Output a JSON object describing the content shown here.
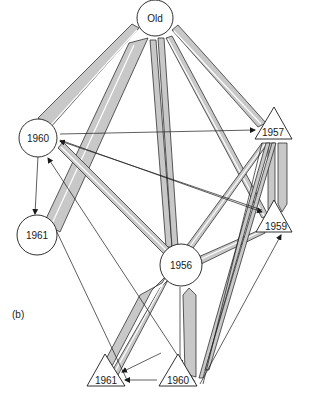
{
  "figure": {
    "panel_label": "(b)",
    "nodes": [
      {
        "id": "old",
        "label": "Old",
        "shape": "circle"
      },
      {
        "id": "c1960",
        "label": "1960",
        "shape": "circle"
      },
      {
        "id": "c1961",
        "label": "1961",
        "shape": "circle"
      },
      {
        "id": "c1956",
        "label": "1956",
        "shape": "circle"
      },
      {
        "id": "t1957",
        "label": "1957",
        "shape": "triangle"
      },
      {
        "id": "t1959",
        "label": "1959",
        "shape": "triangle"
      },
      {
        "id": "t1961",
        "label": "1961",
        "shape": "triangle"
      },
      {
        "id": "t1960",
        "label": "1960",
        "shape": "triangle"
      }
    ],
    "colors": {
      "band_fill": "#c8c8c8",
      "stroke": "#1a1a1a",
      "background": "#ffffff"
    }
  }
}
